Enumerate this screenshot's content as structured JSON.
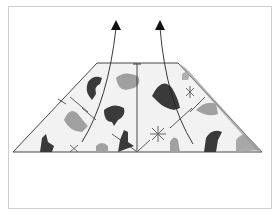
{
  "diagram": {
    "type": "origami-fold-step",
    "colors": {
      "frame": "#cfcfcf",
      "outline": "#333333",
      "paper": "#f2f2f2",
      "motif_dark": "#3a3a3a",
      "motif_light": "#9a9a9a",
      "arrow": "#111111"
    },
    "arrows": [
      {
        "label": "fold-up-left",
        "direction": "up"
      },
      {
        "label": "fold-up-right",
        "direction": "up"
      }
    ]
  }
}
